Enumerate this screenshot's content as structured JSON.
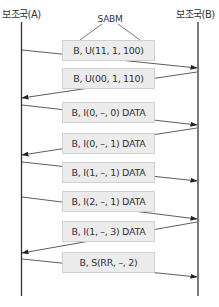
{
  "stations": {
    "a": "보조국(A)",
    "b": "보조국(B)"
  },
  "annotation": "SABM",
  "frames": [
    {
      "label": "B, U(11, 1, 100)",
      "direction": "A→B",
      "top": 40
    },
    {
      "label": "B, U(00, 1, 110)",
      "direction": "B→A",
      "top": 68
    },
    {
      "label": "B, I(0, –, 0) DATA",
      "direction": "A→B",
      "top": 102
    },
    {
      "label": "B, I(0, –, 1) DATA",
      "direction": "B→A",
      "top": 133
    },
    {
      "label": "B, I(1, –, 1) DATA",
      "direction": "A→B",
      "top": 162
    },
    {
      "label": "B, I(2, –, 1) DATA",
      "direction": "A→B",
      "top": 191
    },
    {
      "label": "B, I(1, –, 3) DATA",
      "direction": "B→A",
      "top": 221
    },
    {
      "label": "B, S(RR, –, 2)",
      "direction": "A→B",
      "top": 252
    }
  ],
  "colors": {
    "box_fill": "#ececec",
    "box_border": "#d0d0d0",
    "line": "#333333"
  }
}
